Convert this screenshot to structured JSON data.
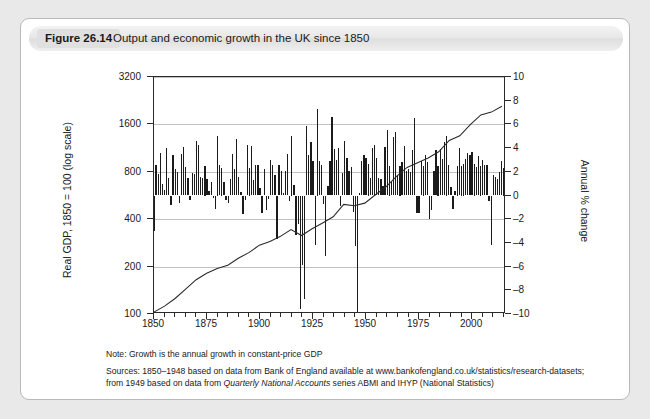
{
  "figure": {
    "number_label": "Figure 26.14",
    "title": "Output and economic growth in the UK since 1850"
  },
  "notes": {
    "note": "Note: Growth is the annual growth in constant-price GDP",
    "sources_label": "Sources:",
    "sources_line1": "Sources: 1850–1948 based on data from Bank of England available at www.bankofengland.co.uk/statistics/research-datasets;",
    "sources_line2_a": "from 1949 based on data from ",
    "sources_line2_italic": "Quarterly National Accounts",
    "sources_line2_b": " series ABMI and IHYP (National Statistics)"
  },
  "axes": {
    "left_label": "Real GDP, 1850 = 100 (log scale)",
    "right_label": "Annual % change",
    "left_ticks": [
      "3200",
      "1600",
      "800",
      "400",
      "200",
      "100"
    ],
    "left_tick_values": [
      3200,
      1600,
      800,
      400,
      200,
      100
    ],
    "right_ticks": [
      "10",
      "8",
      "6",
      "4",
      "2",
      "0",
      "–2",
      "–4",
      "–6",
      "–8",
      "–10"
    ],
    "right_tick_values": [
      10,
      8,
      6,
      4,
      2,
      0,
      -2,
      -4,
      -6,
      -8,
      -10
    ],
    "x_ticks": [
      "1850",
      "1875",
      "1900",
      "1925",
      "1950",
      "1975",
      "2000"
    ],
    "x_tick_values": [
      1850,
      1875,
      1900,
      1925,
      1950,
      1975,
      2000
    ],
    "x_range": [
      1850,
      2016
    ],
    "x_minor_step": 5,
    "left_scale": "log",
    "left_range": [
      100,
      3200
    ],
    "right_range": [
      -10,
      10
    ]
  },
  "chart_data": {
    "type": "bar",
    "title": "Output and economic growth in the UK since 1850",
    "subtitle": "",
    "xlabel": "",
    "ylabel": "Annual % change",
    "ylabel_secondary": "Real GDP, 1850 = 100 (log scale)",
    "ylim": [
      -10,
      10
    ],
    "ylim_secondary": [
      100,
      3200
    ],
    "xlim": [
      1850,
      2016
    ],
    "grid": true,
    "legend": "none",
    "series": [
      {
        "name": "Annual % change in real GDP",
        "type": "bar",
        "axis": "right",
        "x": [
          1850,
          1851,
          1852,
          1853,
          1854,
          1855,
          1856,
          1857,
          1858,
          1859,
          1860,
          1861,
          1862,
          1863,
          1864,
          1865,
          1866,
          1867,
          1868,
          1869,
          1870,
          1871,
          1872,
          1873,
          1874,
          1875,
          1876,
          1877,
          1878,
          1879,
          1880,
          1881,
          1882,
          1883,
          1884,
          1885,
          1886,
          1887,
          1888,
          1889,
          1890,
          1891,
          1892,
          1893,
          1894,
          1895,
          1896,
          1897,
          1898,
          1899,
          1900,
          1901,
          1902,
          1903,
          1904,
          1905,
          1906,
          1907,
          1908,
          1909,
          1910,
          1911,
          1912,
          1913,
          1914,
          1915,
          1916,
          1917,
          1918,
          1919,
          1920,
          1921,
          1922,
          1923,
          1924,
          1925,
          1926,
          1927,
          1928,
          1929,
          1930,
          1931,
          1932,
          1933,
          1934,
          1935,
          1936,
          1937,
          1938,
          1939,
          1940,
          1941,
          1942,
          1943,
          1944,
          1945,
          1946,
          1947,
          1948,
          1949,
          1950,
          1951,
          1952,
          1953,
          1954,
          1955,
          1956,
          1957,
          1958,
          1959,
          1960,
          1961,
          1962,
          1963,
          1964,
          1965,
          1966,
          1967,
          1968,
          1969,
          1970,
          1971,
          1972,
          1973,
          1974,
          1975,
          1976,
          1977,
          1978,
          1979,
          1980,
          1981,
          1982,
          1983,
          1984,
          1985,
          1986,
          1987,
          1988,
          1989,
          1990,
          1991,
          1992,
          1993,
          1994,
          1995,
          1996,
          1997,
          1998,
          1999,
          2000,
          2001,
          2002,
          2003,
          2004,
          2005,
          2006,
          2007,
          2008,
          2009,
          2010,
          2011,
          2012,
          2013,
          2014,
          2015
        ],
        "values": [
          -3.0,
          2.6,
          1.8,
          3.6,
          1.0,
          0.5,
          4.0,
          1.5,
          -0.8,
          3.4,
          2.2,
          2.0,
          -0.6,
          3.5,
          4.1,
          2.4,
          1.5,
          -0.4,
          1.9,
          1.8,
          4.6,
          4.3,
          1.6,
          1.5,
          2.5,
          1.4,
          0.4,
          1.1,
          -0.2,
          -1.1,
          5.0,
          2.6,
          2.3,
          1.1,
          -0.4,
          -0.6,
          1.4,
          3.5,
          2.2,
          4.8,
          1.6,
          0.3,
          -1.6,
          -0.4,
          4.3,
          2.3,
          4.2,
          1.3,
          2.6,
          2.6,
          0.6,
          -1.5,
          2.2,
          -1.2,
          -0.3,
          3.0,
          2.6,
          1.7,
          -3.7,
          2.6,
          2.1,
          0.2,
          2.1,
          3.5,
          -0.5,
          5.0,
          0.9,
          -3.3,
          -2.4,
          -9.6,
          -5.9,
          -8.7,
          5.9,
          3.4,
          4.5,
          2.9,
          -4.2,
          7.3,
          2.9,
          2.6,
          -0.7,
          -5.1,
          0.8,
          2.9,
          6.6,
          3.9,
          3.0,
          4.0,
          -0.9,
          1.9,
          4.6,
          3.2,
          2.1,
          2.4,
          -1.4,
          -4.3,
          -10.0,
          0.2,
          2.9,
          3.4,
          3.2,
          2.7,
          1.5,
          4.0,
          4.3,
          3.2,
          1.5,
          1.4,
          0.8,
          4.1,
          5.5,
          2.5,
          1.1,
          4.9,
          5.4,
          1.7,
          2.5,
          2.8,
          4.2,
          2.1,
          2.2,
          2.0,
          3.8,
          6.5,
          -1.5,
          -1.5,
          2.9,
          2.5,
          3.4,
          2.8,
          -2.0,
          -1.2,
          2.1,
          3.8,
          2.5,
          3.9,
          3.1,
          4.5,
          5.0,
          2.6,
          0.7,
          -1.1,
          0.4,
          2.5,
          4.0,
          2.5,
          2.7,
          3.1,
          3.6,
          3.4,
          3.7,
          2.7,
          2.4,
          3.3,
          2.5,
          3.0,
          2.6,
          2.6,
          -0.5,
          -4.2,
          1.7,
          1.6,
          1.4,
          2.0,
          2.9,
          2.3
        ]
      },
      {
        "name": "Real GDP index, 1850 = 100",
        "type": "line",
        "axis": "left",
        "x": [
          1850,
          1855,
          1860,
          1865,
          1870,
          1875,
          1880,
          1885,
          1890,
          1895,
          1900,
          1905,
          1910,
          1915,
          1920,
          1925,
          1930,
          1935,
          1940,
          1945,
          1950,
          1955,
          1960,
          1965,
          1970,
          1975,
          1980,
          1985,
          1990,
          1995,
          2000,
          2005,
          2010,
          2015
        ],
        "values": [
          100,
          109,
          122,
          140,
          161,
          177,
          190,
          199,
          221,
          240,
          268,
          283,
          305,
          337,
          309,
          341,
          372,
          407,
          489,
          479,
          498,
          564,
          633,
          739,
          843,
          904,
          971,
          1063,
          1256,
          1344,
          1583,
          1831,
          1906,
          2081
        ]
      }
    ]
  }
}
